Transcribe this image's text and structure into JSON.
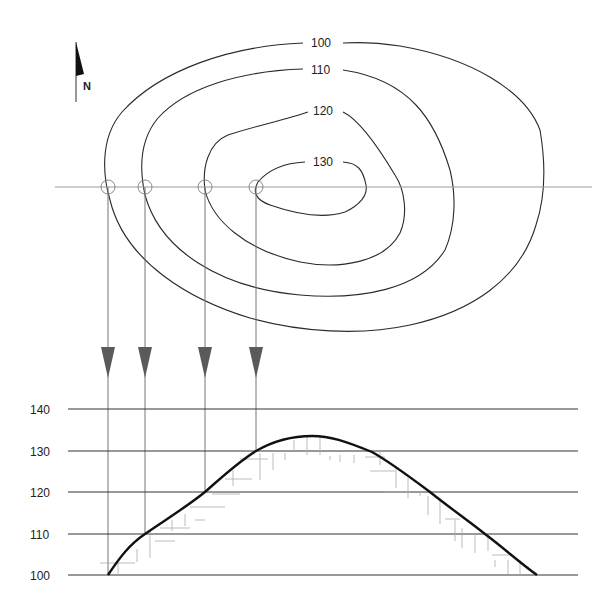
{
  "diagram": {
    "north_arrow": {
      "label": "N",
      "icon": "north-arrow-icon"
    },
    "contours": [
      {
        "value": "100",
        "label": "100"
      },
      {
        "value": "110",
        "label": "110"
      },
      {
        "value": "120",
        "label": "120"
      },
      {
        "value": "130",
        "label": "130"
      }
    ],
    "section_line": {
      "intersections": 4
    },
    "profile": {
      "elevation_labels": [
        "140",
        "130",
        "120",
        "110",
        "100"
      ]
    },
    "colors": {
      "contour": "#2a2a2a",
      "section_line": "#9a9a9a",
      "arrow": "#5a5a5a",
      "profile_curve": "#111111",
      "grid": "#333333",
      "hatching": "#aaaaaa"
    }
  }
}
